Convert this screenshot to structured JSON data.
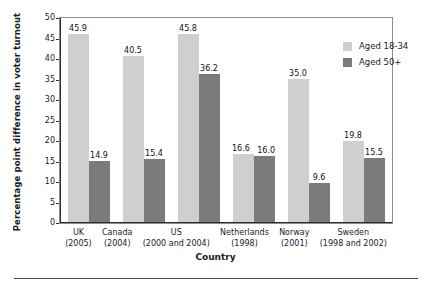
{
  "chart_data": {
    "type": "bar",
    "title": "",
    "xlabel": "Country",
    "ylabel": "Percentage point difference in voter turnout",
    "ylim": [
      0,
      50
    ],
    "yticks": [
      0,
      5,
      10,
      15,
      20,
      25,
      30,
      35,
      40,
      45,
      50
    ],
    "ytick_labels": [
      "0",
      "5",
      "10",
      "15",
      "20",
      "25",
      "30",
      "35",
      "40",
      "45",
      "50"
    ],
    "grid": false,
    "legend_position": "top-right",
    "categories": [
      "UK (2005)",
      "Canada (2004)",
      "US (2000 and 2004)",
      "Netherlands (1998)",
      "Norway (2001)",
      "Sweden (1998 and 2002)"
    ],
    "category_names": [
      "UK",
      "Canada",
      "US",
      "Netherlands",
      "Norway",
      "Sweden"
    ],
    "category_years": [
      "(2005)",
      "(2004)",
      "(2000 and 2004)",
      "(1998)",
      "(2001)",
      "(1998 and 2002)"
    ],
    "series": [
      {
        "name": "Aged 18-34",
        "color": "#cfcfcf",
        "values": [
          45.9,
          40.5,
          45.8,
          16.6,
          35.0,
          19.8
        ],
        "labels": [
          "45.9",
          "40.5",
          "45.8",
          "16.6",
          "35.0",
          "19.8"
        ]
      },
      {
        "name": "Aged 50+",
        "color": "#7b7b7b",
        "values": [
          14.9,
          15.4,
          36.2,
          16.0,
          9.6,
          15.5
        ],
        "labels": [
          "14.9",
          "15.4",
          "36.2",
          "16.0",
          "9.6",
          "15.5"
        ]
      }
    ]
  },
  "legend": {
    "items": [
      {
        "label": "Aged 18-34",
        "color": "#cfcfcf"
      },
      {
        "label": "Aged 50+",
        "color": "#7b7b7b"
      }
    ]
  },
  "colors": {
    "series_light": "#cfcfcf",
    "series_dark": "#7b7b7b",
    "axis": "#2c2c2c",
    "frame": "#8d8d8d",
    "text": "#1a1a1a",
    "background": "#ffffff"
  }
}
